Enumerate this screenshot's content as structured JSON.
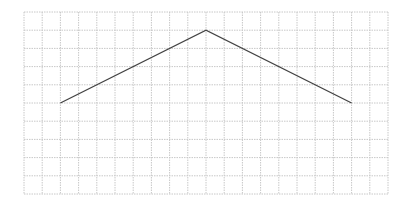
{
  "diagram": {
    "type": "polyline-on-grid",
    "grid": {
      "columns": 20,
      "rows": 10,
      "origin_x": 24,
      "origin_y": 12,
      "cell_size": 18.2,
      "line_color": "#c8c8c8",
      "line_style": "dotted"
    },
    "polyline": {
      "color": "#444444",
      "width": 1.3,
      "points_grid": [
        [
          2,
          5
        ],
        [
          10,
          1
        ],
        [
          18,
          5
        ]
      ]
    }
  }
}
